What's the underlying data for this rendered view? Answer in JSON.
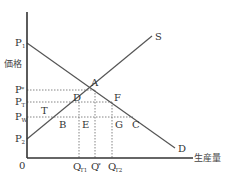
{
  "title": "",
  "axes": {
    "y_label": "価格",
    "x_label": "生産量",
    "origin_label": "0"
  },
  "curves": {
    "supply": {
      "label": "S"
    },
    "demand": {
      "label": "D"
    }
  },
  "price_labels": [
    {
      "id": "P1",
      "main": "P",
      "sub": "1"
    },
    {
      "id": "Pstar",
      "main": "P",
      "sub": "*"
    },
    {
      "id": "PT",
      "main": "P",
      "sub": "T"
    },
    {
      "id": "PW",
      "main": "P",
      "sub": "W"
    },
    {
      "id": "P2",
      "main": "P",
      "sub": "2"
    }
  ],
  "quantity_labels": [
    {
      "id": "QT1",
      "main": "Q",
      "sub": "T1"
    },
    {
      "id": "Qstar",
      "main": "Q",
      "sub": "*"
    },
    {
      "id": "QT2",
      "main": "Q",
      "sub": "T2"
    }
  ],
  "points": {
    "A": "A",
    "B": "B",
    "C": "C",
    "D": "D",
    "E": "E",
    "F": "F",
    "G": "G",
    "T": "T"
  }
}
